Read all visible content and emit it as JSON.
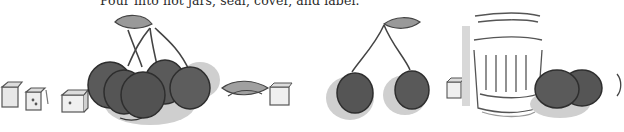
{
  "document": {
    "instruction_text": "Pour into hot jars, seal, cover, and label."
  },
  "illustrations": [
    {
      "name": "sugar-cubes-left",
      "description": "three sugar cubes"
    },
    {
      "name": "cherry-cluster",
      "description": "bunch of cherries with leaf and stems"
    },
    {
      "name": "leaf-and-sugar-cube",
      "description": "loose leaf beside a sugar cube"
    },
    {
      "name": "cherry-pair",
      "description": "two cherries on stems with a leaf"
    },
    {
      "name": "sugar-cube-small",
      "description": "single sugar cube"
    },
    {
      "name": "glass-jar",
      "description": "fluted glass jar"
    },
    {
      "name": "cherries-right",
      "description": "two cherries beside jar"
    }
  ],
  "colors": {
    "cherry": "#5a5a5a",
    "cherry_outline": "#2e2e2e",
    "shadow": "#c8c8c8",
    "leaf": "#9a9a9a",
    "text": "#2a2a2a"
  }
}
